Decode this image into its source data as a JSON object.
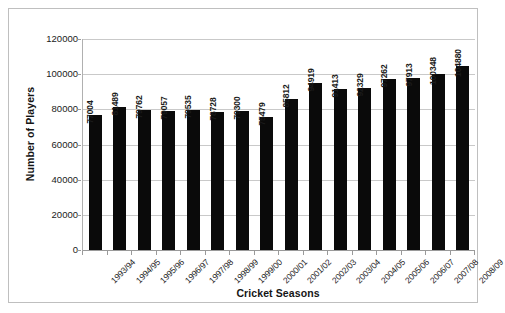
{
  "chart_data": {
    "type": "bar",
    "title": "",
    "xlabel": "Cricket Seasons",
    "ylabel": "Number of Players",
    "ylim": [
      0,
      120000
    ],
    "ytick_step": 20000,
    "ytick_labels": [
      "0",
      "20000",
      "40000",
      "60000",
      "80000",
      "100000",
      "120000"
    ],
    "grid": "horizontal",
    "legend": "none",
    "bar_color": "#0a0a0a",
    "gridline_color": "#c9c9c9",
    "categories": [
      "1993/94",
      "1994/95",
      "1995/96",
      "1996/97",
      "1997/98",
      "1998/99",
      "1999/00",
      "2000/01",
      "2001/02",
      "2002/03",
      "2003/04",
      "2004/05",
      "2005/06",
      "2006/07",
      "2007/08",
      "2008/09"
    ],
    "values": [
      77004,
      81489,
      79762,
      79057,
      79535,
      78728,
      79300,
      75479,
      85812,
      94919,
      91413,
      92329,
      97262,
      97913,
      100348,
      104880
    ],
    "value_labels": [
      "77004",
      "81489",
      "79762",
      "79057",
      "79535",
      "78728",
      "79300",
      "75479",
      "85812",
      "94919",
      "91413",
      "92329",
      "97262",
      "97913",
      "100348",
      "104880"
    ]
  }
}
